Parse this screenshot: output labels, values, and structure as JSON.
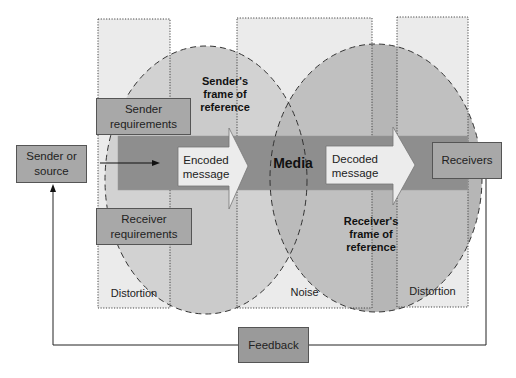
{
  "diagram": {
    "type": "communication-process-model",
    "nodes": {
      "sender": "Sender or source",
      "sender_requirements": "Sender requirements",
      "receiver_requirements": "Receiver requirements",
      "encoded_message": "Encoded message",
      "media": "Media",
      "decoded_message": "Decoded message",
      "receivers": "Receivers",
      "feedback": "Feedback"
    },
    "regions": {
      "sender_frame": "Sender's frame of reference",
      "receiver_frame": "Receiver's frame of reference",
      "distortion_left": "Distortion",
      "noise": "Noise",
      "distortion_right": "Distortion"
    },
    "edges": [
      {
        "from": "Sender or source",
        "to": "Encoded message"
      },
      {
        "from": "Encoded message",
        "to": "Media"
      },
      {
        "from": "Media",
        "to": "Decoded message"
      },
      {
        "from": "Decoded message",
        "to": "Receivers"
      },
      {
        "from": "Receivers",
        "to": "Feedback"
      },
      {
        "from": "Feedback",
        "to": "Sender or source"
      }
    ],
    "colors": {
      "band": "#8c8c8c",
      "circle_left": "#c8c8c8",
      "circle_right": "#b3b3b3",
      "columns": "#e6e6e6",
      "box": "#a8a8a8",
      "arrow_fill": "#ececec"
    }
  }
}
